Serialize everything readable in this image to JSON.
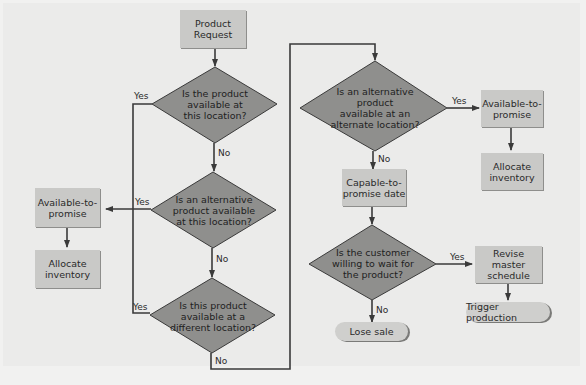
{
  "colors": {
    "background": "#ebebea",
    "process_box": "#c9c9c7",
    "decision": "#8f8f8d",
    "line": "#3a3a3a"
  },
  "nodes": {
    "product_request": "Product\nRequest",
    "d1": "Is the product\navailable at\nthis location?",
    "d2": "Is an alternative\nproduct available\nat this location?",
    "d3": "Is this product\navailable at a\ndifferent location?",
    "d4": "Is an alternative\nproduct\navailable at an\nalternate location?",
    "d5": "Is the customer\nwilling to wait for\nthe product?",
    "atp_left": "Available-to-\npromise",
    "alloc_left": "Allocate\ninventory",
    "atp_right": "Available-to-\npromise",
    "alloc_right": "Allocate\ninventory",
    "ctp": "Capable-to-\npromise date",
    "revise": "Revise master\nschedule",
    "trigger": "Trigger production",
    "lose": "Lose sale"
  },
  "labels": {
    "d1_yes": "Yes",
    "d1_no": "No",
    "d2_yes": "Yes",
    "d2_no": "No",
    "d3_yes": "Yes",
    "d3_no": "No",
    "d4_yes": "Yes",
    "d4_no": "No",
    "d5_yes": "Yes",
    "d5_no": "No"
  }
}
